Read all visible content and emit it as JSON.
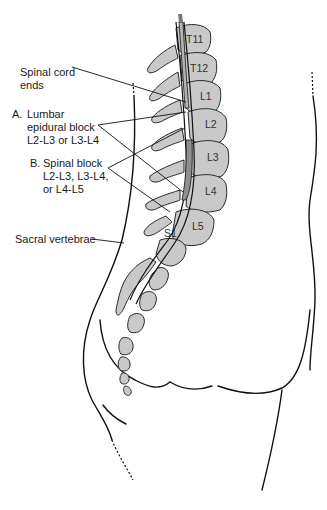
{
  "diagram": {
    "type": "anatomical-illustration",
    "colors": {
      "vertebra_fill": "#c9c9c9",
      "spinal_cord_fill": "#b5b5b5",
      "dural_sac_fill": "#8f8f8f",
      "line": "#111111",
      "background": "#ffffff"
    },
    "labels": {
      "spinal_cord_ends": {
        "line1": "Spinal cord",
        "line2": "ends"
      },
      "lumbar_epidural": {
        "marker": "A.",
        "line1": "Lumbar",
        "line2": "epidural block",
        "line3": "L2-L3 or L3-L4"
      },
      "spinal_block": {
        "marker": "B.",
        "line1": "Spinal block",
        "line2": "L2-L3, L3-L4,",
        "line3": "or L4-L5"
      },
      "sacral_vertebrae": "Sacral vertebrae"
    },
    "vertebrae": [
      {
        "id": "T11",
        "label": "T11"
      },
      {
        "id": "T12",
        "label": "T12"
      },
      {
        "id": "L1",
        "label": "L1"
      },
      {
        "id": "L2",
        "label": "L2"
      },
      {
        "id": "L3",
        "label": "L3"
      },
      {
        "id": "L4",
        "label": "L4"
      },
      {
        "id": "L5",
        "label": "L5"
      },
      {
        "id": "S1",
        "label": "S1"
      }
    ]
  }
}
